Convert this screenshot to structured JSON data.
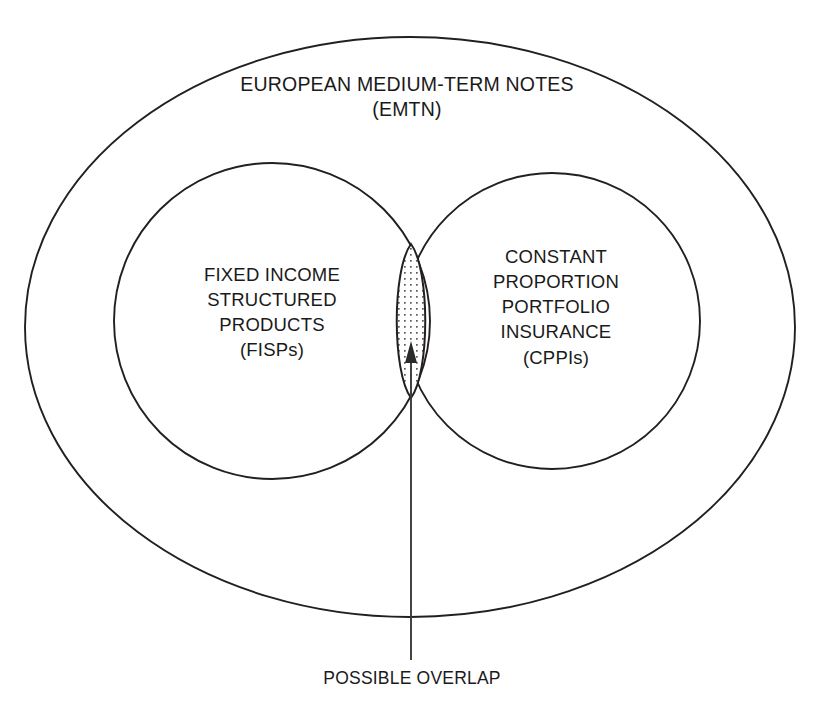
{
  "diagram": {
    "type": "venn-euler-diagram",
    "title_region": {
      "name": "European Medium-Term Notes outer set",
      "label": "EUROPEAN MEDIUM-TERM NOTES\n(EMTN)",
      "line1": "EUROPEAN MEDIUM-TERM NOTES",
      "line2": "(EMTN)",
      "abbreviation": "EMTN"
    },
    "left_set": {
      "name": "Fixed Income Structured Products",
      "label": "FIXED INCOME\nSTRUCTURED\nPRODUCTS\n(FISPs)",
      "line1": "FIXED INCOME",
      "line2": "STRUCTURED",
      "line3": "PRODUCTS",
      "line4": "(FISPs)",
      "abbreviation": "FISPs"
    },
    "right_set": {
      "name": "Constant Proportion Portfolio Insurance",
      "label": "CONSTANT\nPROPORTION\nPORTFOLIO\nINSURANCE\n(CPPIs)",
      "line1": "CONSTANT",
      "line2": "PROPORTION",
      "line3": "PORTFOLIO",
      "line4": "INSURANCE",
      "line5": "(CPPIs)",
      "abbreviation": "CPPIs"
    },
    "intersection": {
      "name": "possible overlap lens",
      "caption": "POSSIBLE OVERLAP",
      "fill_style": "stippled-dots"
    },
    "colors": {
      "stroke": "#231f20",
      "background": "#ffffff",
      "text": "#1a1a1a",
      "leader": "#3a3a3a",
      "dots": "#5a5a5a"
    },
    "geometry": {
      "outer_ellipse": {
        "cx": 410,
        "cy": 327,
        "rx": 385,
        "ry": 290
      },
      "left_circle": {
        "cx": 272,
        "cy": 321,
        "r": 158
      },
      "right_circle": {
        "cx": 552,
        "cy": 321,
        "r": 148
      },
      "lens_top": {
        "x": 411,
        "y": 244
      },
      "lens_bottom": {
        "x": 411,
        "y": 398
      },
      "arrow_tip": {
        "x": 411,
        "y": 342
      },
      "leader_bottom": {
        "x": 411,
        "y": 660
      }
    }
  }
}
